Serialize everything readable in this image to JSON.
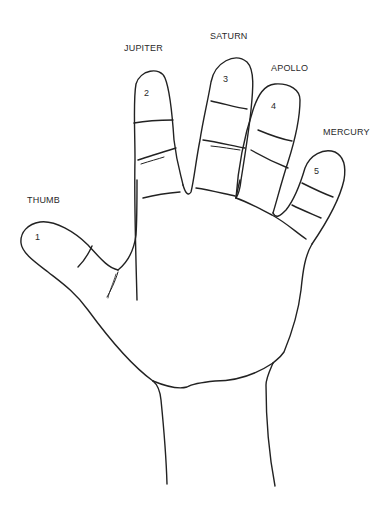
{
  "diagram": {
    "type": "palmistry hand diagram",
    "fingers": [
      {
        "number": "1",
        "name": "THUMB"
      },
      {
        "number": "2",
        "name": "JUPITER"
      },
      {
        "number": "3",
        "name": "SATURN"
      },
      {
        "number": "4",
        "name": "APOLLO"
      },
      {
        "number": "5",
        "name": "MERCURY"
      }
    ],
    "line_color": "#222222",
    "background": "#ffffff"
  }
}
